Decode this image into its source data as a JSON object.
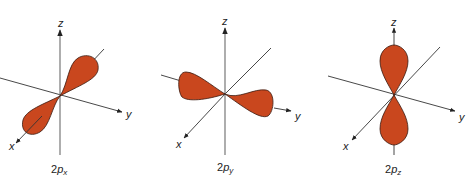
{
  "figure": {
    "colors": {
      "lobe_fill": "#C9471E",
      "lobe_stroke": "#3a1a10",
      "axis": "#333333",
      "z_axis": "#777777"
    },
    "panels": [
      {
        "id": "2px",
        "label_main": "2p",
        "label_n": "2",
        "label_p": "p",
        "label_sub": "x",
        "axes": {
          "z": "z",
          "y": "y",
          "x": "x"
        },
        "lobe_orientation": "x"
      },
      {
        "id": "2py",
        "label_main": "2p",
        "label_n": "2",
        "label_p": "p",
        "label_sub": "y",
        "axes": {
          "z": "z",
          "y": "y",
          "x": "x"
        },
        "lobe_orientation": "y"
      },
      {
        "id": "2pz",
        "label_main": "2p",
        "label_n": "2",
        "label_p": "p",
        "label_sub": "z",
        "axes": {
          "z": "z",
          "y": "y",
          "x": "x"
        },
        "lobe_orientation": "z"
      }
    ]
  }
}
